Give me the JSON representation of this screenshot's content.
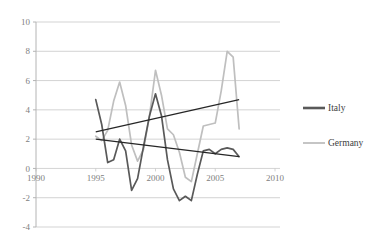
{
  "chart_data": {
    "type": "line",
    "title": "",
    "xlabel": "",
    "ylabel": "",
    "xlim": [
      1990,
      2010
    ],
    "ylim": [
      -4,
      10
    ],
    "grid": true,
    "legend_position": "right",
    "xticks": [
      1990,
      1995,
      2000,
      2005,
      2010
    ],
    "yticks": [
      -4,
      -2,
      0,
      2,
      4,
      6,
      8,
      10
    ],
    "xtick_labels": [
      "1990",
      "1995",
      "2000",
      "2005",
      "2010"
    ],
    "ytick_labels": [
      "-4",
      "-2",
      "0",
      "2",
      "4",
      "6",
      "8",
      "10"
    ],
    "series": [
      {
        "name": "Italy",
        "color": "#595959",
        "x": [
          1995,
          1995.5,
          1996,
          1996.5,
          1997,
          1997.5,
          1998,
          1998.5,
          1999,
          1999.5,
          2000,
          2000.5,
          2001,
          2001.5,
          2002,
          2002.5,
          2003,
          2003.5,
          2004,
          2004.5,
          2005,
          2005.5,
          2006,
          2006.5,
          2007
        ],
        "y": [
          4.7,
          3.0,
          0.4,
          0.6,
          2.0,
          1.2,
          -1.5,
          -0.7,
          1.5,
          3.6,
          5.1,
          3.6,
          0.6,
          -1.4,
          -2.2,
          -1.9,
          -2.2,
          -0.4,
          1.2,
          1.3,
          1.0,
          1.3,
          1.4,
          1.3,
          0.8
        ]
      },
      {
        "name": "Germany",
        "color": "#bfbfbf",
        "x": [
          1995,
          1995.5,
          1996,
          1996.5,
          1997,
          1997.5,
          1998,
          1998.5,
          1999,
          1999.5,
          2000,
          2000.5,
          2001,
          2001.5,
          2002,
          2002.5,
          2003,
          2003.5,
          2004,
          2004.5,
          2005,
          2005.5,
          2006,
          2006.5,
          2007
        ],
        "y": [
          2.2,
          1.9,
          2.6,
          4.6,
          5.9,
          4.3,
          1.6,
          0.5,
          1.3,
          3.6,
          6.7,
          5.0,
          2.7,
          2.3,
          1.1,
          -0.6,
          -0.9,
          1.0,
          2.9,
          3.0,
          3.1,
          5.3,
          8.0,
          7.6,
          2.7
        ]
      }
    ],
    "trendlines": [
      {
        "name": "rising-trendline",
        "color": "#262626",
        "x": [
          1995,
          2007
        ],
        "y": [
          2.5,
          4.7
        ]
      },
      {
        "name": "falling-trendline",
        "color": "#262626",
        "x": [
          1995,
          2007
        ],
        "y": [
          2.0,
          0.8
        ]
      }
    ],
    "legend": [
      {
        "label": "Italy",
        "color": "#595959"
      },
      {
        "label": "Germany",
        "color": "#bfbfbf"
      }
    ]
  }
}
